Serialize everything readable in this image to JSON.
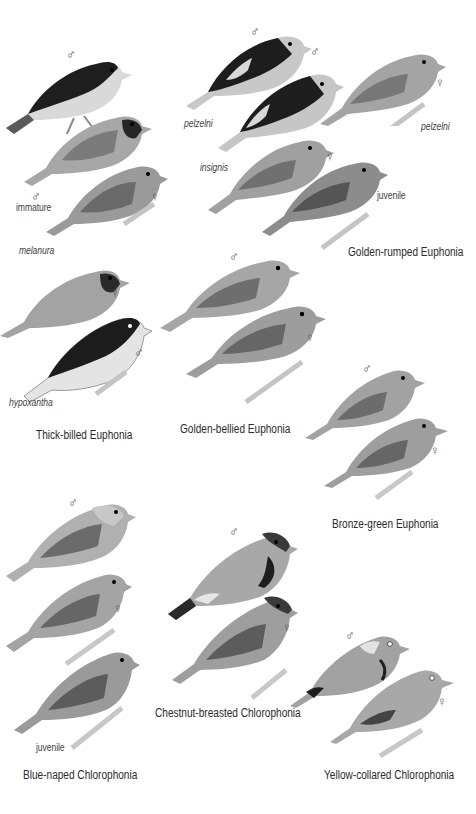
{
  "plate": {
    "symbols": {
      "male": "♂",
      "female": "♀"
    },
    "species": [
      {
        "name": "Thick-billed Euphonia",
        "labels": {
          "immature": "immature",
          "subspecies_1": "melanura",
          "subspecies_2": "hypoxantha"
        },
        "figures": [
          "male",
          "male immature",
          "female",
          "female melanura",
          "male hypoxantha"
        ]
      },
      {
        "name": "Golden-rumped Euphonia",
        "labels": {
          "subspecies_1": "pelzelni",
          "subspecies_2": "insignis",
          "subspecies_3": "pelzelni",
          "juvenile": "juvenile"
        },
        "figures": [
          "male pelzelni",
          "male insignis",
          "female pelzelni",
          "female insignis",
          "juvenile"
        ]
      },
      {
        "name": "Golden-bellied Euphonia",
        "figures": [
          "male",
          "female"
        ]
      },
      {
        "name": "Bronze-green Euphonia",
        "figures": [
          "male",
          "female"
        ]
      },
      {
        "name": "Blue-naped Chlorophonia",
        "labels": {
          "juvenile": "juvenile"
        },
        "figures": [
          "male",
          "female",
          "juvenile"
        ]
      },
      {
        "name": "Chestnut-breasted Chlorophonia",
        "figures": [
          "male",
          "female"
        ]
      },
      {
        "name": "Yellow-collared Chlorophonia",
        "figures": [
          "male",
          "female"
        ]
      }
    ]
  }
}
